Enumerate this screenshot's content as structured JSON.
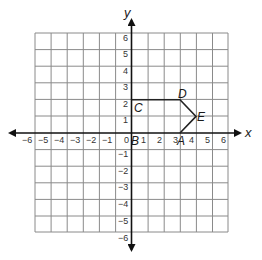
{
  "graph": {
    "x_axis_label": "x",
    "y_axis_label": "y",
    "x_range": [
      -6,
      6
    ],
    "y_range": [
      -6,
      6
    ],
    "grid": true,
    "x_tick_labels": [
      "−6",
      "−5",
      "−4",
      "−3",
      "−2",
      "−1",
      "0",
      "1",
      "2",
      "3",
      "4",
      "5",
      "6"
    ],
    "y_tick_labels_positive": [
      "1",
      "2",
      "3",
      "4",
      "5",
      "6"
    ],
    "y_tick_labels_negative": [
      "−1",
      "−2",
      "−3",
      "−4",
      "−5",
      "−6"
    ],
    "colors": {
      "grid": "#8a8a8a",
      "axis": "#111111",
      "shape": "#222222"
    }
  },
  "shape": {
    "vertices": [
      {
        "label": "A",
        "x": 3,
        "y": 0
      },
      {
        "label": "B",
        "x": 0,
        "y": 0
      },
      {
        "label": "C",
        "x": 0,
        "y": 2
      },
      {
        "label": "D",
        "x": 3,
        "y": 2
      },
      {
        "label": "E",
        "x": 4,
        "y": 1
      }
    ],
    "drawn_path": [
      "C",
      "D",
      "E",
      "A"
    ]
  },
  "labels": {
    "A": "A",
    "B": "B",
    "C": "C",
    "D": "D",
    "E": "E"
  }
}
